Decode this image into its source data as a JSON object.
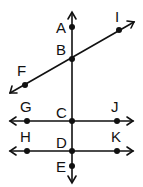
{
  "diagram": {
    "points": {
      "A": {
        "label": "A",
        "x": 72,
        "y": 27
      },
      "B": {
        "label": "B",
        "x": 72,
        "y": 59
      },
      "C": {
        "label": "C",
        "x": 72,
        "y": 121
      },
      "D": {
        "label": "D",
        "x": 72,
        "y": 151
      },
      "E": {
        "label": "E",
        "x": 72,
        "y": 166
      },
      "F": {
        "label": "F",
        "x": 25,
        "y": 85
      },
      "I": {
        "label": "I",
        "x": 119,
        "y": 30
      },
      "G": {
        "label": "G",
        "x": 27,
        "y": 121
      },
      "J": {
        "label": "J",
        "x": 117,
        "y": 121
      },
      "H": {
        "label": "H",
        "x": 27,
        "y": 151
      },
      "K": {
        "label": "K",
        "x": 117,
        "y": 151
      }
    },
    "lines": [
      {
        "name": "vertical-line-AE",
        "through": [
          "A",
          "B",
          "C",
          "D",
          "E"
        ]
      },
      {
        "name": "line-FI",
        "through": [
          "F",
          "B",
          "I"
        ]
      },
      {
        "name": "line-GJ",
        "through": [
          "G",
          "C",
          "J"
        ]
      },
      {
        "name": "line-HK",
        "through": [
          "H",
          "D",
          "K"
        ]
      }
    ],
    "color": "#111111"
  }
}
